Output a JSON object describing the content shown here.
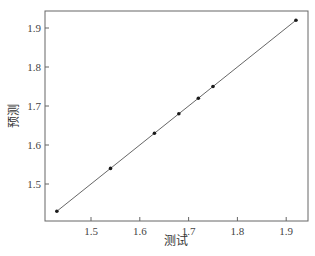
{
  "chart_data": {
    "type": "line",
    "title": "",
    "xlabel": "测试",
    "ylabel": "预测",
    "xlim": [
      1.41,
      1.95
    ],
    "ylim": [
      1.41,
      1.95
    ],
    "xticks": [
      1.5,
      1.6,
      1.7,
      1.8,
      1.9
    ],
    "yticks": [
      1.5,
      1.6,
      1.7,
      1.8,
      1.9
    ],
    "xtick_labels": [
      "1.5",
      "1.6",
      "1.7",
      "1.8",
      "1.9"
    ],
    "ytick_labels": [
      "1.5",
      "1.6",
      "1.7",
      "1.8",
      "1.9"
    ],
    "grid": false,
    "legend": null,
    "series": [
      {
        "name": "预测 vs 测试",
        "marker": "circle",
        "color": "#222222",
        "x": [
          1.43,
          1.54,
          1.63,
          1.68,
          1.72,
          1.75,
          1.92
        ],
        "y": [
          1.43,
          1.54,
          1.63,
          1.68,
          1.72,
          1.75,
          1.92
        ]
      }
    ]
  },
  "colors": {
    "axis": "#666666",
    "line": "#555555",
    "marker": "#1a1a1a"
  }
}
